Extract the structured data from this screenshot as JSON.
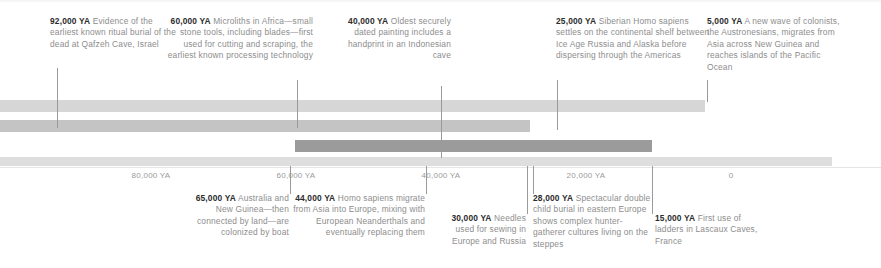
{
  "figure": {
    "type": "timeline",
    "units": "YA (years ago)",
    "axis": {
      "ticks": [
        {
          "label": "80,000 YA",
          "value": 80000,
          "x": 151
        },
        {
          "label": "60,000 YA",
          "value": 60000,
          "x": 296
        },
        {
          "label": "40,000 YA",
          "value": 40000,
          "x": 441
        },
        {
          "label": "20,000 YA",
          "value": 20000,
          "x": 586
        },
        {
          "label": "0",
          "value": 0,
          "x": 731
        }
      ]
    },
    "bands": [
      {
        "name": "band-1",
        "left": 0,
        "width": 705,
        "top": 100,
        "height": 12,
        "color": "#d6d6d6"
      },
      {
        "name": "band-2",
        "left": 0,
        "width": 530,
        "top": 120,
        "height": 12,
        "color": "#c4c4c4"
      },
      {
        "name": "band-3",
        "left": 295,
        "width": 357,
        "top": 140,
        "height": 12,
        "color": "#9b9b9b"
      },
      {
        "name": "band-4",
        "left": 0,
        "width": 832,
        "top": 157,
        "height": 9,
        "color": "#dedede"
      }
    ]
  },
  "notes_top": [
    {
      "id": "note-92000",
      "year": "92,000 YA",
      "text": " Evidence of the earliest known ritual burial of the dead at Qafzeh Cave, Israel",
      "align": "left",
      "x": 50,
      "y": 16,
      "width": 128,
      "leader": {
        "x": 57,
        "y": 68,
        "height": 60
      }
    },
    {
      "id": "note-60000",
      "year": "60,000 YA",
      "text": " Microliths in Africa—small stone tools, including blades—first used for cutting and scraping, the earliest known processing technology",
      "align": "right",
      "x": 162,
      "y": 16,
      "width": 151,
      "leader": {
        "x": 297,
        "y": 80,
        "height": 48
      }
    },
    {
      "id": "note-40000",
      "year": "40,000 YA",
      "text": " Oldest securely dated painting includes a handprint in an Indonesian cave",
      "align": "right",
      "x": 338,
      "y": 16,
      "width": 113,
      "leader": {
        "x": 441,
        "y": 86,
        "height": 72
      }
    },
    {
      "id": "note-25000",
      "year": "25,000 YA",
      "text": " Siberian Homo sapiens settles on the continental shelf between Ice Age Russia and Alaska before dispersing through the Americas",
      "align": "left",
      "x": 556,
      "y": 16,
      "width": 156,
      "leader": {
        "x": 557,
        "y": 80,
        "height": 50
      }
    },
    {
      "id": "note-5000",
      "year": "5,000 YA",
      "text": " A new wave of colonists, the Austronesians, migrates from Asia across New Guinea and reaches islands of the Pacific Ocean",
      "align": "left",
      "x": 707,
      "y": 16,
      "width": 140,
      "leader": {
        "x": 707,
        "y": 80,
        "height": 22
      }
    }
  ],
  "notes_bottom": [
    {
      "id": "note-65000",
      "year": "65,000 YA",
      "text": " Australia and New Guinea—then connected by land—are colonized by boat",
      "align": "right",
      "x": 176,
      "y": 193,
      "width": 113,
      "leader": {
        "x": 290,
        "y": 166,
        "height": 28
      }
    },
    {
      "id": "note-44000",
      "year": "44,000 YA",
      "text": " Homo sapiens migrate from Asia into Europe, mixing with European Neanderthals and eventually replacing them",
      "align": "right",
      "x": 291,
      "y": 193,
      "width": 134,
      "leader": {
        "x": 426,
        "y": 166,
        "height": 28
      }
    },
    {
      "id": "note-30000",
      "year": "30,000 YA",
      "text": " Needles used for sewing in Europe and Russia",
      "align": "right",
      "x": 437,
      "y": 213,
      "width": 89,
      "leader": {
        "x": 527,
        "y": 166,
        "height": 48
      }
    },
    {
      "id": "note-28000",
      "year": "28,000 YA",
      "text": " Spectacular double child burial in eastern Europe shows complex hunter-gatherer cultures living on the steppes",
      "align": "left",
      "x": 533,
      "y": 193,
      "width": 118,
      "leader": {
        "x": 533,
        "y": 166,
        "height": 28
      }
    },
    {
      "id": "note-15000",
      "year": "15,000 YA",
      "text": " First use of ladders in Lascaux Caves, France",
      "align": "left",
      "x": 655,
      "y": 213,
      "width": 104,
      "leader": {
        "x": 652,
        "y": 166,
        "height": 48
      }
    }
  ]
}
